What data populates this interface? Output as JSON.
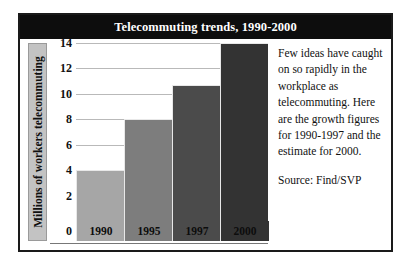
{
  "figure": {
    "title": "Telecommuting trends, 1990-2000",
    "caption": "Few ideas have caught on so rapidly in the workplace as telecommuting. Here are the growth figures for 1990-1997 and the estimate for 2000.",
    "source": "Source: Find/SVP",
    "frame_color": "#1a1a1a",
    "title_band_color": "#0d0d0d",
    "title_text_color": "#ffffff"
  },
  "chart_data": {
    "type": "bar",
    "title": "Telecommuting trends, 1990-2000",
    "categories": [
      "1990",
      "1995",
      "1997",
      "2000"
    ],
    "values": [
      4,
      8,
      10.7,
      14
    ],
    "xlabel": "",
    "ylabel": "Millions of workers telecommuting",
    "ylim": [
      0,
      14
    ],
    "yticks": [
      0,
      2,
      4,
      6,
      8,
      10,
      12,
      14
    ],
    "ytick_labels": [
      "0",
      "2",
      "4",
      "6",
      "8",
      "10",
      "12",
      "14"
    ],
    "grid": true,
    "gridline_color": "#b9b9b9",
    "legend": false,
    "bar_colors": [
      "#a6a6a6",
      "#7d7d7d",
      "#4b4b4b",
      "#333333"
    ],
    "annotations": []
  },
  "axis": {
    "y_title_background": "#c3c3c3"
  }
}
